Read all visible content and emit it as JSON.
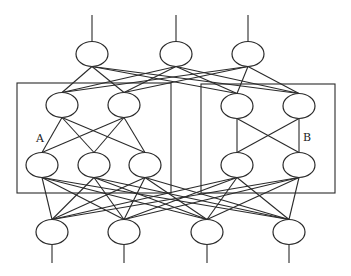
{
  "diagram": {
    "type": "neural-network",
    "labels": {
      "module_a": "A",
      "module_b": "B"
    },
    "colors": {
      "stroke": "#2a2a2a",
      "background": "#ffffff"
    },
    "boxes": [
      {
        "id": "module-a",
        "x": 17,
        "y": 83,
        "w": 154,
        "h": 110
      },
      {
        "id": "module-b",
        "x": 201,
        "y": 84,
        "w": 134,
        "h": 109
      }
    ],
    "layers": {
      "output": [
        {
          "x": 92,
          "y": 54
        },
        {
          "x": 176,
          "y": 54
        },
        {
          "x": 248,
          "y": 54
        }
      ],
      "hidden2": [
        {
          "x": 62,
          "y": 105,
          "module": "A"
        },
        {
          "x": 124,
          "y": 105,
          "module": "A"
        },
        {
          "x": 237,
          "y": 106,
          "module": "B"
        },
        {
          "x": 299,
          "y": 106,
          "module": "B"
        }
      ],
      "hidden1": [
        {
          "x": 42,
          "y": 165,
          "module": "A"
        },
        {
          "x": 94,
          "y": 165,
          "module": "A"
        },
        {
          "x": 145,
          "y": 165,
          "module": "A"
        },
        {
          "x": 237,
          "y": 165,
          "module": "B"
        },
        {
          "x": 299,
          "y": 165,
          "module": "B"
        }
      ],
      "input": [
        {
          "x": 52,
          "y": 232
        },
        {
          "x": 124,
          "y": 232
        },
        {
          "x": 207,
          "y": 232
        },
        {
          "x": 289,
          "y": 232
        }
      ]
    },
    "node_radius": {
      "rx": 16,
      "ry": 12.5
    },
    "terminal_lines": {
      "top_y": 15,
      "bottom_y": 263
    }
  }
}
